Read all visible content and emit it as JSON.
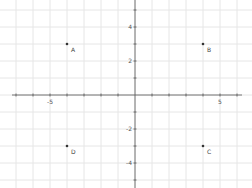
{
  "chart_data": {
    "type": "scatter",
    "title": "",
    "xlabel": "",
    "ylabel": "",
    "xlim": [
      -8,
      7
    ],
    "ylim": [
      -5,
      5.5
    ],
    "grid": true,
    "x_tick_labels": [
      {
        "value": -5,
        "label": "-5"
      },
      {
        "value": 5,
        "label": "5"
      }
    ],
    "y_tick_labels": [
      {
        "value": 4,
        "label": "4"
      },
      {
        "value": 2,
        "label": "2"
      },
      {
        "value": -2,
        "label": "-2"
      },
      {
        "value": -4,
        "label": "-4"
      }
    ],
    "points": [
      {
        "label": "A",
        "x": -4,
        "y": 3
      },
      {
        "label": "B",
        "x": 4,
        "y": 3
      },
      {
        "label": "C",
        "x": 4,
        "y": -3
      },
      {
        "label": "D",
        "x": -4,
        "y": -3
      }
    ],
    "colors": {
      "grid": "#e6e6e6",
      "axis": "#555555",
      "point": "#333333"
    }
  }
}
